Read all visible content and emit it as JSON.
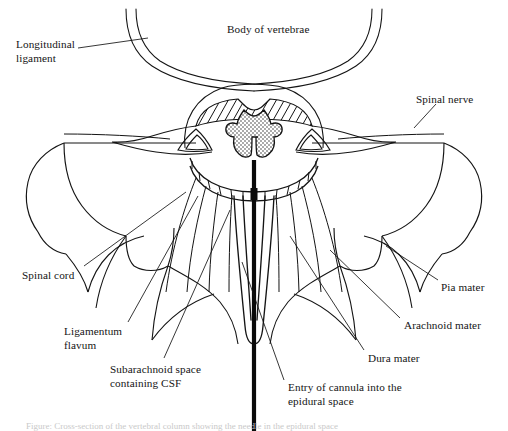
{
  "figure": {
    "background_color": "#ffffff",
    "ink_color": "#141414",
    "caption_text": "Figure: Cross-section of the vertebral column showing the needle in the epidural space",
    "caption_visible": "clipped"
  },
  "labels": [
    {
      "id": "longitudinal-ligament",
      "text": "Longitudinal\nligament",
      "x": 16,
      "y": 38,
      "align": "left"
    },
    {
      "id": "body-of-vertebrae",
      "text": "Body of vertebrae",
      "x": 227,
      "y": 23,
      "align": "left"
    },
    {
      "id": "spinal-nerve",
      "text": "Spinal nerve",
      "x": 416,
      "y": 93,
      "align": "left"
    },
    {
      "id": "spinal-cord",
      "text": "Spinal cord",
      "x": 22,
      "y": 269,
      "align": "left"
    },
    {
      "id": "pia-mater",
      "text": "Pia mater",
      "x": 441,
      "y": 281,
      "align": "left"
    },
    {
      "id": "arachnoid-mater",
      "text": "Arachnoid mater",
      "x": 404,
      "y": 319,
      "align": "left"
    },
    {
      "id": "ligamentum-flavum",
      "text": "Ligamentum\nflavum",
      "x": 64,
      "y": 325,
      "align": "left"
    },
    {
      "id": "dura-mater",
      "text": "Dura mater",
      "x": 368,
      "y": 352,
      "align": "left"
    },
    {
      "id": "subarachnoid-space",
      "text": "Subarachnoid space\ncontaining CSF",
      "x": 110,
      "y": 363,
      "align": "left"
    },
    {
      "id": "entry-of-cannula",
      "text": "Entry of cannula into the\nepidural space",
      "x": 288,
      "y": 381,
      "align": "left"
    }
  ],
  "anatomy_parts": [
    "vertebral-body",
    "posterior-longitudinal-ligament",
    "spinal-cord-grey-matter",
    "ligamentum-flavum",
    "dural-sac",
    "spinal-nerve-roots",
    "transverse-process",
    "paraspinal-muscle",
    "epidural-cannula"
  ]
}
